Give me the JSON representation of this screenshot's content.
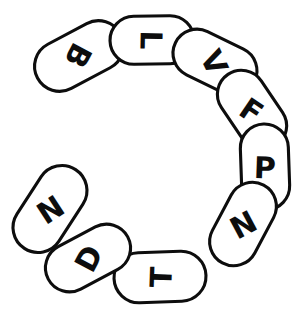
{
  "figure": {
    "name": "letter-ring-diagram",
    "background_color": "#ffffff",
    "stroke_color": "#0d0d0d",
    "fill_color": "#ffffff",
    "stroke_width": 3.1,
    "center": {
      "x": 154,
      "y": 160
    },
    "ring_radius": 112,
    "gap": {
      "present": true,
      "location": "upper-left",
      "between": [
        "N",
        "B"
      ],
      "start_angle_deg": 186,
      "end_angle_deg": 226
    },
    "letter_sequence_clockwise": [
      "B",
      "L",
      "V",
      "F",
      "P",
      "N",
      "T",
      "D",
      "N"
    ],
    "bead_count": 9,
    "beads": [
      {
        "index": 0,
        "letter": "B",
        "cx": 79,
        "cy": 56,
        "angle_deg": 28,
        "length": 94,
        "thickness": 50,
        "letter_rotation_deg": 118
      },
      {
        "index": 1,
        "letter": "L",
        "cx": 152,
        "cy": 40,
        "angle_deg": 1,
        "length": 84,
        "thickness": 48,
        "letter_rotation_deg": 91
      },
      {
        "index": 2,
        "letter": "V",
        "cx": 215,
        "cy": 62,
        "angle_deg": 334,
        "length": 88,
        "thickness": 48,
        "letter_rotation_deg": 64
      },
      {
        "index": 3,
        "letter": "F",
        "cx": 252,
        "cy": 110,
        "angle_deg": 304,
        "length": 86,
        "thickness": 48,
        "letter_rotation_deg": 34
      },
      {
        "index": 4,
        "letter": "P",
        "cx": 265,
        "cy": 167,
        "angle_deg": 272,
        "length": 86,
        "thickness": 48,
        "letter_rotation_deg": 2
      },
      {
        "index": 5,
        "letter": "N",
        "cx": 243,
        "cy": 224,
        "angle_deg": 242,
        "length": 88,
        "thickness": 48,
        "letter_rotation_deg": 332
      },
      {
        "index": 6,
        "letter": "T",
        "cx": 160,
        "cy": 277,
        "angle_deg": 182,
        "length": 92,
        "thickness": 50,
        "letter_rotation_deg": 272
      },
      {
        "index": 7,
        "letter": "D",
        "cx": 88,
        "cy": 258,
        "angle_deg": 208,
        "length": 90,
        "thickness": 48,
        "letter_rotation_deg": 298
      },
      {
        "index": 8,
        "letter": "N",
        "cx": 50,
        "cy": 209,
        "angle_deg": 237,
        "length": 94,
        "thickness": 50,
        "letter_rotation_deg": 327
      }
    ]
  }
}
